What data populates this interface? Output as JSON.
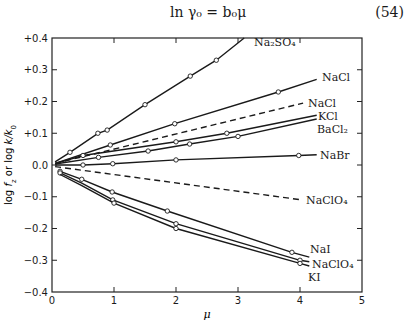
{
  "equation": {
    "text": "ln γ₀ = b₀μ",
    "number": "(54)"
  },
  "chart_data": {
    "type": "line",
    "title": "",
    "xlabel": "μ",
    "ylabel": "log f_z or log k/k_0",
    "xlim": [
      0,
      5
    ],
    "ylim": [
      -0.4,
      0.4
    ],
    "x_ticks": [
      "0",
      "1",
      "2",
      "3",
      "4",
      "5"
    ],
    "y_ticks": [
      "+0.4",
      "+0.3",
      "+0.2",
      "+0.1",
      "0.0",
      "−0.1",
      "−0.2",
      "−0.3",
      "−0.4"
    ],
    "grid": false,
    "legend": "inline labels at line ends",
    "series": [
      {
        "name": "Na2SO4",
        "label": "Na₂SO₄",
        "style": "solid",
        "x": [
          0.05,
          0.29,
          0.74,
          0.89,
          1.5,
          2.23,
          2.65,
          3.1
        ],
        "y": [
          0.01,
          0.04,
          0.1,
          0.11,
          0.19,
          0.28,
          0.33,
          0.4
        ],
        "markers": [
          0.29,
          0.74,
          0.89,
          1.5,
          2.23,
          2.65
        ]
      },
      {
        "name": "NaCl",
        "label": "NaCl",
        "style": "solid",
        "x": [
          0.05,
          0.94,
          1.98,
          3.65,
          4.27
        ],
        "y": [
          0.005,
          0.063,
          0.13,
          0.23,
          0.27
        ],
        "markers": [
          0.94,
          1.98,
          3.65
        ]
      },
      {
        "name": "NaCl (dashed)",
        "label": "NaCl",
        "style": "dashed",
        "x": [
          0.05,
          4.05
        ],
        "y": [
          0.005,
          0.195
        ],
        "markers": []
      },
      {
        "name": "KCl",
        "label": "KCl",
        "style": "solid",
        "x": [
          0.05,
          0.5,
          2.0,
          2.82,
          4.27
        ],
        "y": [
          0.004,
          0.03,
          0.073,
          0.1,
          0.157
        ],
        "markers": [
          0.5,
          2.0,
          2.82
        ]
      },
      {
        "name": "BaCl2",
        "label": "BaCl₂",
        "style": "solid",
        "x": [
          0.05,
          0.75,
          1.55,
          2.22,
          3.0,
          4.27
        ],
        "y": [
          0.003,
          0.024,
          0.044,
          0.066,
          0.09,
          0.145
        ],
        "markers": [
          0.75,
          1.55,
          2.22,
          3.0
        ]
      },
      {
        "name": "NaBr",
        "label": "NaBr",
        "style": "solid",
        "x": [
          0.05,
          0.5,
          0.98,
          2.0,
          3.98,
          4.27
        ],
        "y": [
          0.0,
          0.0,
          0.004,
          0.016,
          0.03,
          0.032
        ],
        "markers": [
          0.5,
          0.98,
          2.0,
          3.98
        ]
      },
      {
        "name": "NaClO4 (dashed)",
        "label": "NaClO₄",
        "style": "dashed",
        "x": [
          0.05,
          4.03
        ],
        "y": [
          -0.005,
          -0.11
        ],
        "markers": []
      },
      {
        "name": "NaI",
        "label": "NaI",
        "style": "solid",
        "x": [
          0.13,
          0.48,
          0.97,
          1.86,
          3.87,
          4.15
        ],
        "y": [
          -0.02,
          -0.045,
          -0.085,
          -0.145,
          -0.275,
          -0.29
        ],
        "markers": [
          0.13,
          0.48,
          0.97,
          1.86,
          3.87
        ]
      },
      {
        "name": "NaClO4",
        "label": "NaClO₄",
        "style": "solid",
        "x": [
          0.13,
          0.48,
          0.98,
          2.0,
          4.0,
          4.15
        ],
        "y": [
          -0.025,
          -0.057,
          -0.11,
          -0.185,
          -0.3,
          -0.305
        ],
        "markers": [
          0.13,
          0.98,
          2.0,
          4.0
        ]
      },
      {
        "name": "KI",
        "label": "KI",
        "style": "solid",
        "x": [
          0.13,
          0.48,
          1.0,
          2.0,
          4.0,
          4.15
        ],
        "y": [
          -0.03,
          -0.065,
          -0.12,
          -0.2,
          -0.31,
          -0.318
        ],
        "markers": [
          1.0,
          2.0,
          4.0
        ]
      }
    ]
  }
}
